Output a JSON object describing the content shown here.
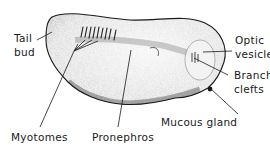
{
  "diagram": {
    "labels": {
      "tail_bud": [
        "Tail",
        "bud"
      ],
      "optic_vesicle": [
        "Optic",
        "vesicle"
      ],
      "branchial_clefts": [
        "Branchial",
        "clefts"
      ],
      "mucous_gland": "Mucous gland",
      "myotomes": "Myotomes",
      "pronephros": "Pronephros"
    },
    "colors": {
      "ink": "#1a1a1a",
      "stipple": "#555555",
      "background": "#ffffff"
    }
  }
}
